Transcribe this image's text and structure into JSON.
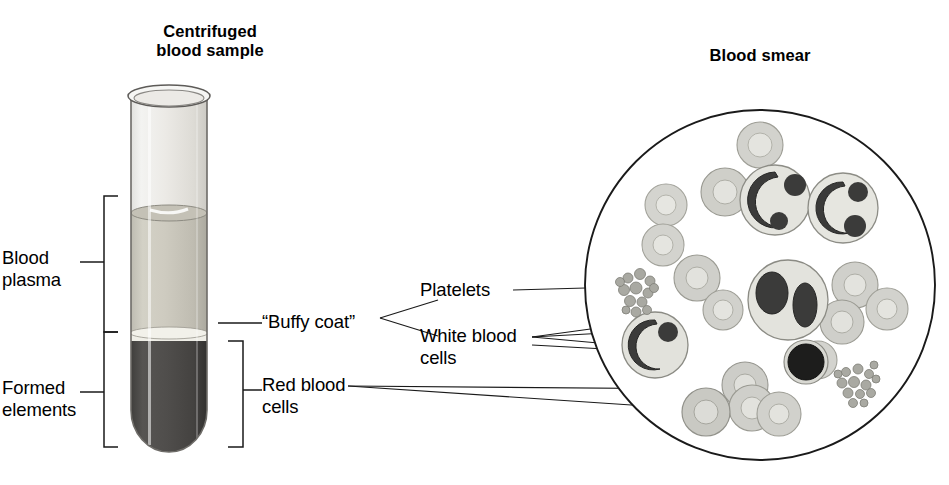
{
  "figure": {
    "kind": "blood-composition-diagram",
    "background_color": "#ffffff",
    "ink_color": "#1a1a1a"
  },
  "titles": {
    "left_line1": "Centrifuged",
    "left_line2": "blood sample",
    "right": "Blood smear"
  },
  "labels": {
    "blood_plasma_line1": "Blood",
    "blood_plasma_line2": "plasma",
    "formed_elements_line1": "Formed",
    "formed_elements_line2": "elements",
    "buffy_coat": "“Buffy coat”",
    "red_blood_cells_line1": "Red blood",
    "red_blood_cells_line2": "cells",
    "platelets": "Platelets",
    "white_blood_cells_line1": "White blood",
    "white_blood_cells_line2": "cells"
  },
  "tube": {
    "name": "centrifuged-test-tube",
    "glass_color": "#e9e9e7",
    "plasma_color": "#c9c7bd",
    "buffy_coat_color": "#efeee8",
    "red_cells_color": "#4c4a48",
    "rim_color": "#f4f4f2",
    "layers": [
      {
        "name": "air-above-plasma",
        "top": 96,
        "bottom": 212
      },
      {
        "name": "blood-plasma",
        "top": 212,
        "bottom": 332
      },
      {
        "name": "buffy-coat",
        "top": 332,
        "bottom": 341
      },
      {
        "name": "red-blood-cells",
        "top": 341,
        "bottom": 452
      }
    ]
  },
  "brackets": {
    "blood_plasma": {
      "top": 196,
      "bottom": 332,
      "x": 104,
      "tick_y": 262
    },
    "formed_elements": {
      "top": 332,
      "bottom": 447,
      "x": 104,
      "tick_y": 392
    },
    "red_blood_cells": {
      "top": 341,
      "bottom": 447,
      "x": 243,
      "tick_y": 390
    }
  },
  "smear": {
    "name": "blood-smear-field",
    "circle": {
      "cx": 760,
      "cy": 285,
      "r": 175
    },
    "rbc_fill": "#d2d2cd",
    "rbc_ring": "#b6b6ae",
    "wbc_cytoplasm": "#e2e2dc",
    "wbc_nucleus": "#3b3b3a",
    "lymphocyte_nucleus": "#1d1d1c",
    "platelet_color": "#a9a9a2",
    "red_blood_cells": [
      {
        "cx": 760,
        "cy": 145,
        "r": 23
      },
      {
        "cx": 725,
        "cy": 192,
        "r": 24
      },
      {
        "cx": 666,
        "cy": 205,
        "r": 21
      },
      {
        "cx": 663,
        "cy": 245,
        "r": 21
      },
      {
        "cx": 697,
        "cy": 278,
        "r": 23
      },
      {
        "cx": 723,
        "cy": 310,
        "r": 20
      },
      {
        "cx": 855,
        "cy": 285,
        "r": 23
      },
      {
        "cx": 842,
        "cy": 322,
        "r": 22
      },
      {
        "cx": 887,
        "cy": 309,
        "r": 21
      },
      {
        "cx": 745,
        "cy": 385,
        "r": 23
      },
      {
        "cx": 752,
        "cy": 405,
        "r": 23
      },
      {
        "cx": 706,
        "cy": 410,
        "r": 24
      },
      {
        "cx": 779,
        "cy": 412,
        "r": 22
      },
      {
        "cx": 818,
        "cy": 360,
        "r": 19
      }
    ],
    "white_blood_cells": [
      {
        "name": "neutrophil-upper-left",
        "cx": 775,
        "cy": 200,
        "r": 35
      },
      {
        "name": "neutrophil-upper-right",
        "cx": 843,
        "cy": 208,
        "r": 35
      },
      {
        "name": "neutrophil-center",
        "cx": 788,
        "cy": 300,
        "r": 40
      },
      {
        "name": "neutrophil-left",
        "cx": 655,
        "cy": 345,
        "r": 33
      },
      {
        "name": "lymphocyte-small-dark",
        "cx": 806,
        "cy": 362,
        "r": 22
      }
    ],
    "platelet_clusters": [
      {
        "name": "platelet-cluster-left",
        "cx": 638,
        "cy": 292,
        "n": 13
      },
      {
        "name": "platelet-cluster-right",
        "cx": 858,
        "cy": 385,
        "n": 14
      }
    ]
  },
  "leader_lines": {
    "platelets_to_cluster": {
      "from": [
        513,
        290
      ],
      "to": [
        620,
        288
      ]
    },
    "wbc_fan": [
      {
        "to": [
          660,
          330
        ],
        "target": "neutrophil-left"
      },
      {
        "to": [
          665,
          345
        ],
        "target": "neutrophil-left-lower"
      },
      {
        "to": [
          780,
          305
        ],
        "target": "neutrophil-center"
      },
      {
        "to": [
          790,
          362
        ],
        "target": "lymphocyte-small-dark"
      }
    ],
    "rbc_lines": [
      {
        "from": [
          345,
          386
        ],
        "to": [
          712,
          388
        ]
      },
      {
        "from": [
          345,
          386
        ],
        "to": [
          730,
          410
        ]
      }
    ]
  }
}
